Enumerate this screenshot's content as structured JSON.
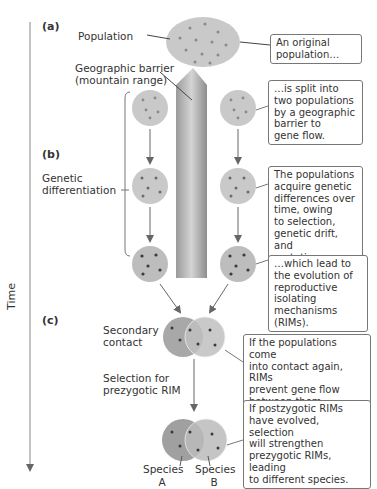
{
  "parts": {
    "a": "(a)",
    "b": "(b)",
    "c": "(c)"
  },
  "axis": {
    "label": "Time"
  },
  "labels": {
    "population": "Population",
    "barrier_line1": "Geographic barrier",
    "barrier_line2": "(mountain range)",
    "genetic1": "Genetic",
    "genetic2": "differentiation",
    "secondary1": "Secondary",
    "secondary2": "contact",
    "selection1": "Selection for",
    "selection2": "prezygotic RIM",
    "speciesA1": "Species",
    "speciesA2": "A",
    "speciesB1": "Species",
    "speciesB2": "B"
  },
  "callouts": [
    {
      "lines": [
        "An original",
        "population…"
      ]
    },
    {
      "lines": [
        "…is split into",
        "two populations",
        "by a geographic",
        "barrier to",
        "gene flow."
      ]
    },
    {
      "lines": [
        "The populations",
        "acquire genetic",
        "differences over",
        "time, owing",
        "to selection,",
        "genetic drift,",
        "and mutations,…"
      ]
    },
    {
      "lines": [
        "…which lead to",
        "the evolution of",
        "reproductive",
        "isolating",
        "mechanisms (RIMs)."
      ]
    },
    {
      "lines": [
        "If the populations come",
        "into contact again, RIMs",
        "prevent gene flow",
        "between them."
      ]
    },
    {
      "lines": [
        "If postzygotic RIMs",
        "have evolved, selection",
        "will strengthen",
        "prezygotic RIMs, leading",
        "to different species."
      ]
    }
  ],
  "colors": {
    "circle": "#c9c9c9",
    "circle_dark": "#a8a8a8",
    "dot_light": "#8a8a8a",
    "dot_dark": "#3a3a3a",
    "mountain": "#b8b8b8",
    "arrow": "#666666"
  }
}
